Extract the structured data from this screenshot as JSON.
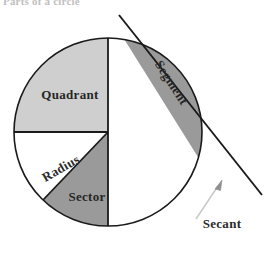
{
  "figure": {
    "caption": "Parts of a circle",
    "type": "geometry-diagram",
    "subject": "circle",
    "colors": {
      "outline": "#1a1a1a",
      "quadrant_fill": "#cfcfcf",
      "sector_fill": "#9a9a9a",
      "segment_fill": "#9a9a9a",
      "background": "#ffffff",
      "label_text": "#2b2b2b",
      "leader_line": "#c9c9c9"
    },
    "circle": {
      "center_x": 108,
      "center_y": 132,
      "radius": 94
    },
    "labels": {
      "quadrant": "Quadrant",
      "sector": "Sector",
      "radius": "Radius",
      "segment": "Segment",
      "secant": "Secant"
    },
    "label_rotations": {
      "quadrant": 0,
      "sector": 0,
      "radius": -30,
      "segment": 57,
      "secant": 0
    },
    "parts": [
      {
        "name": "Quadrant",
        "description": "upper-left quarter of the circle",
        "fill": "#cfcfcf"
      },
      {
        "name": "Sector",
        "description": "wedge bounded by two radii in the lower-left",
        "fill": "#9a9a9a"
      },
      {
        "name": "Segment",
        "description": "region between the secant chord and the arc, upper-right",
        "fill": "#9a9a9a"
      },
      {
        "name": "Radius",
        "description": "line from the centre to the circumference",
        "fill": "none"
      },
      {
        "name": "Secant",
        "description": "straight line cutting the circle at two points",
        "fill": "none"
      }
    ]
  }
}
